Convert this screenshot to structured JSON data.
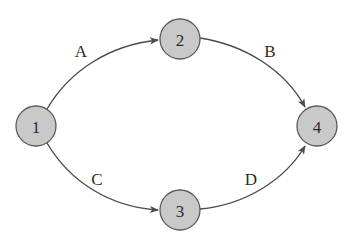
{
  "diagram": {
    "type": "directed-graph",
    "colors": {
      "node_fill": "#c9c9c9",
      "node_stroke": "#5a5a5a",
      "edge": "#4a4a4a",
      "text": "#2a2a2a",
      "background": "#ffffff"
    },
    "nodes": [
      {
        "id": "1",
        "label": "1",
        "x": 36,
        "y": 126,
        "r": 20
      },
      {
        "id": "2",
        "label": "2",
        "x": 180,
        "y": 39,
        "r": 20
      },
      {
        "id": "3",
        "label": "3",
        "x": 180,
        "y": 210,
        "r": 20
      },
      {
        "id": "4",
        "label": "4",
        "x": 317,
        "y": 126,
        "r": 20
      }
    ],
    "edges": [
      {
        "id": "A",
        "label": "A",
        "from": "1",
        "to": "2",
        "label_x": 81,
        "label_y": 51
      },
      {
        "id": "B",
        "label": "B",
        "from": "2",
        "to": "4",
        "label_x": 270,
        "label_y": 51
      },
      {
        "id": "C",
        "label": "C",
        "from": "1",
        "to": "3",
        "label_x": 97,
        "label_y": 179
      },
      {
        "id": "D",
        "label": "D",
        "from": "3",
        "to": "4",
        "label_x": 251,
        "label_y": 179
      }
    ]
  }
}
